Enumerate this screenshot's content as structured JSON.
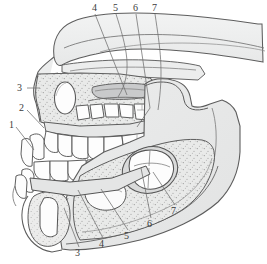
{
  "figure": {
    "background_color": "#ffffff",
    "outline_color": "#555555",
    "bone_fill": "#eceded",
    "bone_fill_dark": "#e0e1e1",
    "spongy_fill": "#e6e7e6",
    "tooth_fill": "#fdfdfd",
    "crypt_shadow": "#cfd0d0",
    "leader_color": "#6d6d6d",
    "label_color": "#3b3b3b"
  },
  "labels": {
    "top": [
      {
        "text": "4",
        "x": 92,
        "y": 3
      },
      {
        "text": "5",
        "x": 113,
        "y": 3
      },
      {
        "text": "6",
        "x": 133,
        "y": 3
      },
      {
        "text": "7",
        "x": 152,
        "y": 3
      }
    ],
    "left": [
      {
        "text": "3",
        "x": 17,
        "y": 85
      },
      {
        "text": "2",
        "x": 19,
        "y": 104
      },
      {
        "text": "1",
        "x": 9,
        "y": 121
      }
    ],
    "bottom": [
      {
        "text": "3",
        "x": 75,
        "y": 249
      },
      {
        "text": "4",
        "x": 99,
        "y": 240
      },
      {
        "text": "5",
        "x": 124,
        "y": 232
      },
      {
        "text": "6",
        "x": 147,
        "y": 220
      },
      {
        "text": "7",
        "x": 171,
        "y": 207
      }
    ]
  },
  "leaders": {
    "top": [
      {
        "name": "leader-top-4",
        "d": "M95,14 L127,95"
      },
      {
        "name": "leader-top-5",
        "d": "M116,14 L130,62 Q134,80 120,96"
      },
      {
        "name": "leader-top-6",
        "d": "M136,14 L150,108 L136,128"
      },
      {
        "name": "leader-top-7",
        "d": "M155,14 L163,58 L158,110"
      }
    ],
    "left": [
      {
        "name": "leader-left-3",
        "d": "M27,88 L39,88"
      },
      {
        "name": "leader-left-2",
        "d": "M27,110 L42,126"
      },
      {
        "name": "leader-left-1",
        "d": "M16,127 L31,148"
      }
    ],
    "bottom": [
      {
        "name": "leader-bottom-3",
        "d": "M79,247 L66,210"
      },
      {
        "name": "leader-bottom-4",
        "d": "M103,238 L79,190"
      },
      {
        "name": "leader-bottom-5",
        "d": "M128,230 L100,188"
      },
      {
        "name": "leader-bottom-6",
        "d": "M151,218 L141,168"
      },
      {
        "name": "leader-bottom-7",
        "d": "M175,205 L154,172"
      }
    ]
  },
  "regions": {
    "cranium": "cranial-vault",
    "orbit": "orbital-floor",
    "maxilla": "maxilla",
    "maxillary_tooth_crypts": "maxillary-tooth-crypts",
    "zygomatic": "zygomatic-arch",
    "mandible_ramus": "mandibular-ramus",
    "mandible_body": "mandibular-body",
    "mandible_condyle": "mandibular-condyle",
    "coronoid": "coronoid-process",
    "molar_crypt": "developing-molar-crypt",
    "upper_teeth": "upper-dental-arch",
    "lower_teeth": "lower-dental-arch",
    "deciduous_teeth": "deciduous-teeth",
    "permanent_teeth": "permanent-teeth"
  }
}
